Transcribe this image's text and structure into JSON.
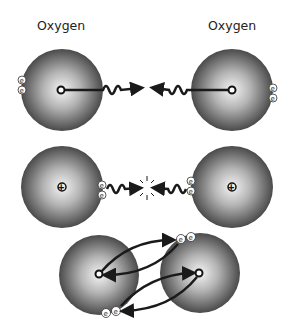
{
  "diagram": {
    "labels": {
      "left_atom": "Oxygen",
      "right_atom": "Oxygen"
    },
    "electron_symbol": "e",
    "nucleus_symbol": "+",
    "colors": {
      "atom_edge": "#505050",
      "atom_center": "#f2f2f2",
      "arrow": "#1a1a1a",
      "background": "#ffffff"
    },
    "panels": [
      {
        "stage": "separate-atoms",
        "description": "Two oxygen atoms attract each other's electrons"
      },
      {
        "stage": "approaching",
        "description": "Electrons meet between atoms"
      },
      {
        "stage": "bonded",
        "description": "Atoms share electron pairs"
      }
    ]
  }
}
